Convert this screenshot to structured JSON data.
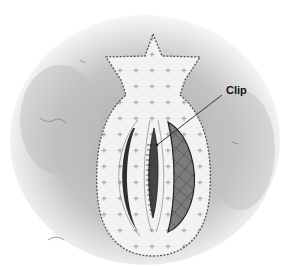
{
  "illustration": {
    "subject": "pomegranate-shaped fabric shape with slits",
    "callout": {
      "label": "Clip"
    },
    "colors": {
      "background_wash": "#b8b8b8",
      "fabric": "#f2f2f2",
      "outline": "#555555",
      "slit_dark": "#3a3a3a",
      "hatch_fill": "#7a7a7a"
    }
  }
}
